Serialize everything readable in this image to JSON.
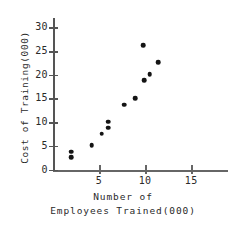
{
  "chart_data": {
    "type": "scatter",
    "title": "",
    "xlabel": "Number of Employees Trained(000)",
    "xlabel_line1": "Number of",
    "xlabel_line2": "Employees Trained(000)",
    "ylabel": "Cost of Training(000)",
    "xlim": [
      0,
      19
    ],
    "ylim": [
      0,
      32
    ],
    "xticks": [
      5,
      10,
      15
    ],
    "xtick_labels": [
      "5",
      "10",
      "15"
    ],
    "yticks": [
      0,
      5,
      10,
      15,
      20,
      25,
      30
    ],
    "ytick_labels": [
      "0",
      "5",
      "10",
      "15",
      "20",
      "25",
      "30"
    ],
    "grid": false,
    "legend": "none",
    "marker_color": "#141414",
    "axis_color": "#555555",
    "points": [
      {
        "x": 2.0,
        "y": 3.8
      },
      {
        "x": 2.0,
        "y": 2.6
      },
      {
        "x": 4.2,
        "y": 5.1
      },
      {
        "x": 5.3,
        "y": 7.6
      },
      {
        "x": 6.0,
        "y": 10.1
      },
      {
        "x": 6.0,
        "y": 8.8
      },
      {
        "x": 7.7,
        "y": 13.7
      },
      {
        "x": 8.9,
        "y": 15.1
      },
      {
        "x": 9.8,
        "y": 26.3
      },
      {
        "x": 9.9,
        "y": 18.8
      },
      {
        "x": 10.5,
        "y": 20.1
      },
      {
        "x": 11.4,
        "y": 22.7
      }
    ]
  }
}
